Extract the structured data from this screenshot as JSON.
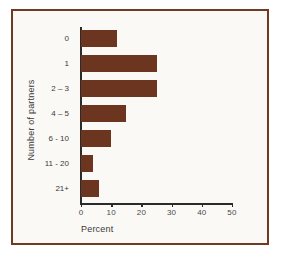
{
  "chart_data": {
    "type": "bar",
    "orientation": "horizontal",
    "title": "",
    "xlabel": "Percent",
    "ylabel": "Number of partners",
    "categories": [
      "0",
      "1",
      "2 – 3",
      "4 – 5",
      "6 - 10",
      "11 - 20",
      "21+"
    ],
    "values": [
      12,
      25,
      25,
      15,
      10,
      4,
      6
    ],
    "xlim": [
      0,
      50
    ],
    "xticks": [
      0,
      10,
      20,
      30,
      40,
      50
    ],
    "xtick_labels": [
      "0",
      "10",
      "20",
      "30",
      "40",
      "50"
    ],
    "grid": false,
    "legend": null,
    "bar_color": "#6B3520",
    "axis_color": "#2B2B2B",
    "frame_color": "#6E3A22",
    "background_color": "#FBF9F6"
  }
}
